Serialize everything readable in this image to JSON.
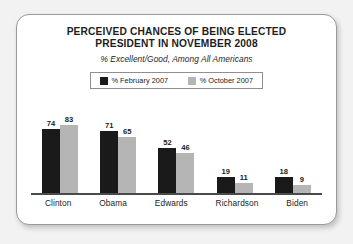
{
  "chart_data": {
    "type": "bar",
    "title": "PERCEIVED CHANCES OF BEING ELECTED PRESIDENT IN NOVEMBER 2008",
    "title_lines": [
      "PERCEIVED CHANCES OF BEING ELECTED",
      "PRESIDENT IN NOVEMBER 2008"
    ],
    "subtitle": "% Excellent/Good, Among All Americans",
    "categories": [
      "Clinton",
      "Obama",
      "Edwards",
      "Richardson",
      "Biden"
    ],
    "series": [
      {
        "name": "% February 2007",
        "color": "#1a1a1a",
        "values": [
          74,
          71,
          52,
          19,
          18
        ]
      },
      {
        "name": "% October 2007",
        "color": "#b5b5b5",
        "values": [
          83,
          65,
          46,
          11,
          9
        ]
      }
    ],
    "xlabel": "",
    "ylabel": "",
    "ylim": [
      0,
      90
    ],
    "grid": false,
    "legend_position": "top-center",
    "value_labels": true
  },
  "colors": {
    "series_february": "#1a1a1a",
    "series_october": "#b5b5b5",
    "axis": "#4a4a4a",
    "card_border": "#9a9a9a",
    "page_background": "#f2f2f2",
    "card_background": "#ffffff",
    "text": "#1d1d1d"
  }
}
